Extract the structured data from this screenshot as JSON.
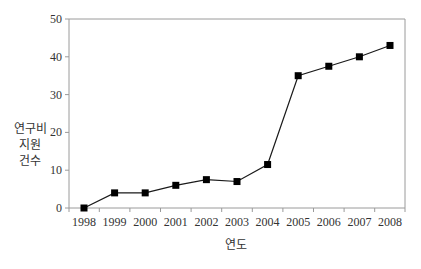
{
  "chart_data": {
    "type": "line",
    "title": "",
    "xlabel": "연도",
    "ylabel": [
      "연구비",
      "지원",
      "건수"
    ],
    "categories": [
      "1998",
      "1999",
      "2000",
      "2001",
      "2002",
      "2003",
      "2004",
      "2005",
      "2006",
      "2007",
      "2008"
    ],
    "series": [
      {
        "name": "연구비 지원 건수",
        "values": [
          0,
          4,
          4,
          6,
          7.5,
          7,
          11.5,
          35,
          37.5,
          40,
          43
        ]
      }
    ],
    "ylim": [
      0,
      50
    ],
    "yticks": [
      0,
      10,
      20,
      30,
      40,
      50
    ],
    "grid": false,
    "legend": "none",
    "marker": "square",
    "colors": {
      "line": "#1a1a1a",
      "marker": "#000000",
      "axis": "#9a9a9a",
      "text": "#333333"
    }
  }
}
